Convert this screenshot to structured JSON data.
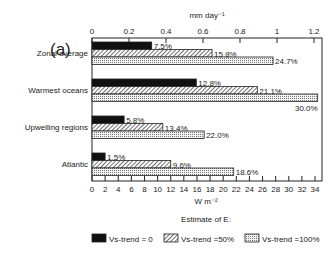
{
  "chart_data": {
    "type": "bar",
    "orientation": "horizontal",
    "panel_label": "(a)",
    "title": "",
    "categories": [
      "Zonal average",
      "Warmest oceans",
      "Upwelling regions",
      "Atlantic"
    ],
    "series": [
      {
        "name": "Vs-trend = 0",
        "pattern": "solid",
        "values": [
          9.1,
          15.9,
          4.9,
          2.0
        ],
        "labels": [
          "7.5%",
          "12.8%",
          "5.8%",
          "1.5%"
        ]
      },
      {
        "name": "Vs-trend =50%",
        "pattern": "hatched",
        "values": [
          18.3,
          25.2,
          10.8,
          12.0
        ],
        "labels": [
          "15.8%",
          "21.1%",
          "13.4%",
          "9.6%"
        ]
      },
      {
        "name": "Vs-trend =100%",
        "pattern": "dotted",
        "values": [
          27.6,
          34.4,
          17.1,
          21.6
        ],
        "labels": [
          "24.7%",
          "30.0%",
          "22.0%",
          "18.6%"
        ]
      }
    ],
    "xlabel": "W m⁻²",
    "xlim": [
      0,
      35
    ],
    "xticks": [
      "0",
      "2",
      "4",
      "6",
      "8",
      "10",
      "12",
      "14",
      "16",
      "18",
      "20",
      "22",
      "24",
      "26",
      "28",
      "30",
      "32",
      "34"
    ],
    "top_axis": {
      "label": "mm day⁻¹",
      "ticks": [
        "0",
        "0.2",
        "0.4",
        "0.6",
        "0.8",
        "1",
        "1.2"
      ],
      "lim": [
        0,
        1.2
      ]
    },
    "legend": {
      "title": "Estimate of E:",
      "position": "bottom",
      "entries": [
        "Vs-trend = 0",
        "Vs-trend =50%",
        "Vs-trend =100%"
      ]
    },
    "grid": false
  },
  "colors": {
    "ink": "#111111",
    "background": "#ffffff"
  }
}
